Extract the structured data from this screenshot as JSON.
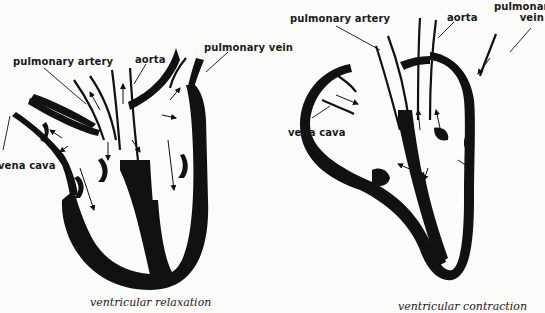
{
  "diagram": {
    "panels": [
      {
        "caption": "ventricular relaxation",
        "labels": {
          "pulmonary_artery": "pulmonary artery",
          "aorta": "aorta",
          "pulmonary_vein": "pulmonary vein",
          "vena_cava": "vena cava"
        }
      },
      {
        "caption": "ventricular contraction",
        "labels": {
          "pulmonary_artery": "pulmonary artery",
          "aorta": "aorta",
          "pulmonary_vein_line1": "pulmonary",
          "pulmonary_vein_line2": "vein",
          "vena_cava": "vena cava"
        }
      }
    ],
    "colors": {
      "ink": "#111111",
      "background": "#fbfbfa"
    }
  }
}
